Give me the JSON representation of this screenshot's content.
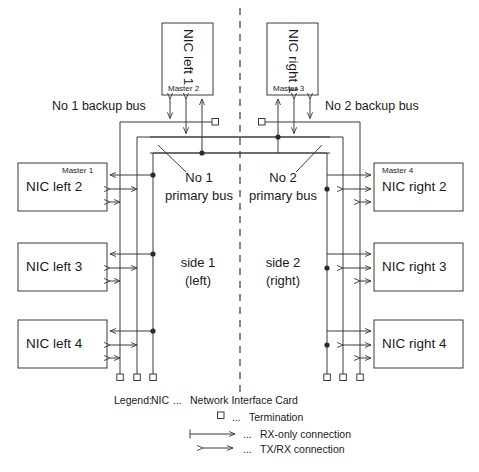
{
  "diagram": {
    "stroke_color": "#3a3a3a",
    "text_color": "#1a1a1a",
    "background": "#ffffff"
  },
  "top_nodes": [
    {
      "name": "NIC left 1",
      "master": "Master 2",
      "side": "left"
    },
    {
      "name": "NIC right 1",
      "master": "Master 3",
      "side": "right"
    }
  ],
  "left_nodes": [
    {
      "name": "NIC left 2",
      "master": "Master 1"
    },
    {
      "name": "NIC left 3",
      "master": ""
    },
    {
      "name": "NIC left 4",
      "master": ""
    }
  ],
  "right_nodes": [
    {
      "name": "NIC right 2",
      "master": "Master 4"
    },
    {
      "name": "NIC right 3",
      "master": ""
    },
    {
      "name": "NIC right 4",
      "master": ""
    }
  ],
  "bus_labels": {
    "backup_left": "No 1 backup bus",
    "backup_right": "No 2 backup bus",
    "primary_left_line1": "No 1",
    "primary_left_line2": "primary bus",
    "primary_right_line1": "No 2",
    "primary_right_line2": "primary bus"
  },
  "side_labels": {
    "left_line1": "side 1",
    "left_line2": "(left)",
    "right_line1": "side 2",
    "right_line2": "(right)"
  },
  "legend": {
    "prefix": "Legend:",
    "items": [
      {
        "key": "NIC",
        "dots": "...",
        "text": "Network Interface Card",
        "symbol": "none"
      },
      {
        "key": "",
        "dots": "...",
        "text": "Termination",
        "symbol": "termination"
      },
      {
        "key": "",
        "dots": "...",
        "text": "RX-only connection",
        "symbol": "rx-only"
      },
      {
        "key": "",
        "dots": "...",
        "text": "TX/RX connection",
        "symbol": "tx-rx"
      }
    ]
  }
}
